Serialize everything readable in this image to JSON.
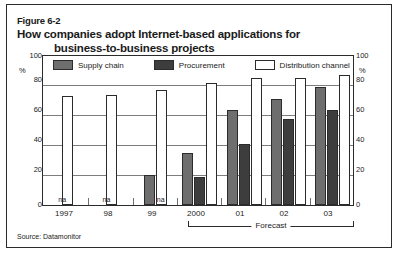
{
  "figure": {
    "number": "Figure 6-2",
    "title_line1": "How companies adopt Internet-based applications for",
    "title_line2": "business-to-business projects",
    "source": "Source: Datamonitor",
    "forecast_label": "Forecast"
  },
  "legend": [
    {
      "label": "Supply chain",
      "color": "#6e6e6e",
      "key": "supply_chain"
    },
    {
      "label": "Procurement",
      "color": "#3d3d3d",
      "key": "procurement"
    },
    {
      "label": "Distribution channel",
      "color": "#ffffff",
      "key": "distribution_channel"
    }
  ],
  "axis": {
    "left_unit": "%",
    "right_unit": "%",
    "ticks": [
      "100",
      "80",
      "60",
      "40",
      "20",
      "0"
    ],
    "na_marker": "na"
  },
  "chart_data": {
    "type": "bar",
    "title": "How companies adopt Internet-based applications for business-to-business projects",
    "xlabel": "",
    "ylabel": "%",
    "ylim": [
      0,
      100
    ],
    "yticks": [
      0,
      20,
      40,
      60,
      80,
      100
    ],
    "grid": true,
    "legend_position": "top-inside",
    "categories": [
      "1997",
      "98",
      "99",
      "2000",
      "01",
      "02",
      "03"
    ],
    "series": [
      {
        "name": "Supply chain",
        "color": "#6e6e6e",
        "values": [
          null,
          null,
          20,
          35,
          64,
          71,
          79
        ]
      },
      {
        "name": "Procurement",
        "color": "#3d3d3d",
        "values": [
          null,
          null,
          null,
          19,
          41,
          58,
          64
        ]
      },
      {
        "name": "Distribution channel",
        "color": "#ffffff",
        "values": [
          73,
          74,
          77,
          82,
          85,
          85,
          87
        ]
      }
    ],
    "annotations": [
      {
        "text": "na",
        "categories": [
          "1997",
          "98",
          "99"
        ]
      },
      {
        "text": "Forecast",
        "spans": [
          "2000",
          "01",
          "02",
          "03"
        ]
      }
    ],
    "source": "Source: Datamonitor"
  },
  "x_labels": [
    "1997",
    "98",
    "99",
    "2000",
    "01",
    "02",
    "03"
  ]
}
